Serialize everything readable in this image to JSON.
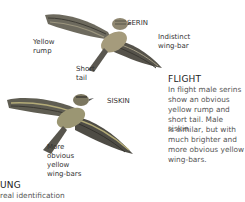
{
  "birds": [
    {
      "name": "SERIN",
      "callouts": [
        "Yellow rump",
        "Short tail",
        "Indistinct wing-bar"
      ]
    },
    {
      "name": "SISKIN",
      "callouts": [
        "More obvious yellow wing-bars"
      ]
    }
  ],
  "labels": {
    "serin": "SERIN",
    "serin_rump_1": "Yellow",
    "serin_rump_2": "rump",
    "serin_tail_1": "Short",
    "serin_tail_2": "tail",
    "serin_wingbar_1": "Indistinct",
    "serin_wingbar_2": "wing-bar",
    "siskin": "SISKIN",
    "siskin_wingbar_1": "More",
    "siskin_wingbar_2": "obvious",
    "siskin_wingbar_3": "yellow",
    "siskin_wingbar_4": "wing-bars"
  },
  "flight": {
    "heading": "FLIGHT",
    "lines": [
      "In flight male serins",
      "show an obvious",
      "yellow rump and",
      "short tail. Male siskin",
      "is similar, but with",
      "much brighter and",
      "more obvious yellow",
      "wing-bars."
    ]
  },
  "young": {
    "heading": "UNG",
    "line": "real identification"
  },
  "colors": {
    "wing_dark": "#4a4a42",
    "wing_mid": "#8a8470",
    "body_buff": "#b8ad8a",
    "siskin_yellow": "#a8a060"
  }
}
